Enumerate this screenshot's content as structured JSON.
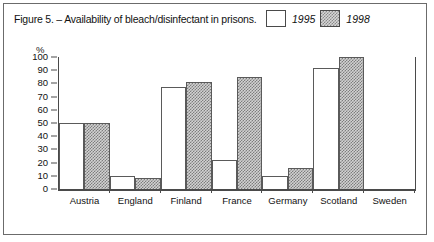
{
  "figure": {
    "title": "Figure 5. – Availability of bleach/disinfectant in prisons."
  },
  "legend": {
    "position": "top-right",
    "entries": [
      {
        "label": "1995",
        "swatch": "white-outline-square"
      },
      {
        "label": "1998",
        "swatch": "gray-checkered-square"
      }
    ]
  },
  "axis": {
    "y_unit_label": "%",
    "y_ticks": [
      100,
      90,
      80,
      70,
      60,
      50,
      40,
      30,
      20,
      10,
      0
    ]
  },
  "chart_data": {
    "type": "bar",
    "title": "Figure 5. – Availability of bleach/disinfectant in prisons.",
    "xlabel": "",
    "ylabel": "%",
    "ylim": [
      0,
      100
    ],
    "grid": false,
    "legend_position": "top-right",
    "categories": [
      "Austria",
      "England",
      "Finland",
      "France",
      "Germany",
      "Scotland",
      "Sweden"
    ],
    "series": [
      {
        "name": "1995",
        "values": [
          50,
          10,
          77,
          22,
          10,
          92,
          0
        ]
      },
      {
        "name": "1998",
        "values": [
          50,
          8,
          81,
          85,
          16,
          100,
          0
        ]
      }
    ]
  },
  "colors": {
    "frame": "#6b6b6b",
    "axis": "#4a4a4a",
    "bar_1995_fill": "#ffffff",
    "bar_1998_fill": "#d2d2d2",
    "bar_outline": "#5a5a5a",
    "text": "#111111"
  }
}
